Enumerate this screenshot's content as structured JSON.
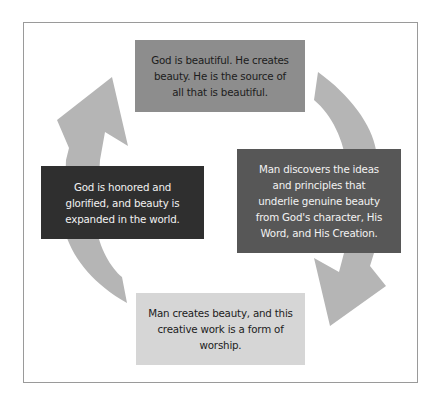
{
  "diagram": {
    "type": "cycle",
    "colors": {
      "arrow": "#b5b5b5",
      "top_box": "#8d8d8d",
      "right_box": "#575757",
      "bottom_box": "#d6d6d6",
      "left_box": "#2f2f2f",
      "frame_border": "#9a9a9a"
    },
    "nodes": [
      {
        "id": "top",
        "text": "God is beautiful. He creates beauty. He is the source of all that is beautiful.",
        "lines": [
          "God is beautiful. He creates",
          "beauty. He is the source of",
          "all that is beautiful."
        ]
      },
      {
        "id": "right",
        "text": "Man discovers the ideas and principles that underlie genuine beauty from God's character, His Word, and His Creation.",
        "lines": [
          "Man discovers the ideas",
          "and principles that",
          "underlie genuine beauty",
          "from God's character, His",
          "Word, and His Creation."
        ]
      },
      {
        "id": "bottom",
        "text": "Man creates beauty, and this creative work is a form of worship.",
        "lines": [
          "Man creates beauty, and this",
          "creative work is a form of",
          "worship."
        ]
      },
      {
        "id": "left",
        "text": "God is honored and glorified, and beauty is expanded in the world.",
        "lines": [
          "God is honored and",
          "glorified, and beauty is",
          "expanded in the world."
        ]
      }
    ],
    "edges": [
      {
        "from": "top",
        "to": "right",
        "direction": "clockwise"
      },
      {
        "from": "right",
        "to": "bottom",
        "direction": "clockwise"
      },
      {
        "from": "bottom",
        "to": "left",
        "direction": "clockwise"
      },
      {
        "from": "left",
        "to": "top",
        "direction": "clockwise"
      }
    ]
  }
}
